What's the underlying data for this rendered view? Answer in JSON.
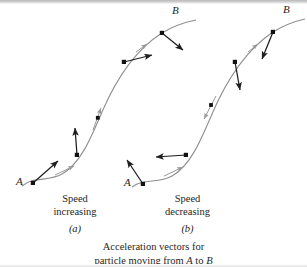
{
  "figure": {
    "caption_line1": "Acceleration vectors for",
    "caption_line2_pre": "particle moving from ",
    "caption_line2_a": "A",
    "caption_line2_mid": " to ",
    "caption_line2_b": "B",
    "background_color": "#ffffff",
    "curve_color": "#8a8a8a",
    "vector_color": "#1e1e1e",
    "tangent_color": "#9a9a9a",
    "point_color": "#111111"
  },
  "panels": [
    {
      "id": "a",
      "letter": "(a)",
      "start_label": "A",
      "end_label": "B",
      "caption_word1": "Speed",
      "caption_word2": "increasing",
      "curve_path": "M 22 186 C 34 176 48 182 62 174 C 80 164 90 140 102 112 C 114 84 132 52 162 33 C 175 25 186 22 196 20",
      "points": [
        {
          "name": "A",
          "x": 33,
          "y": 183
        },
        {
          "name": "p2",
          "x": 77,
          "y": 155
        },
        {
          "name": "p3",
          "x": 98,
          "y": 118
        },
        {
          "name": "p4",
          "x": 124,
          "y": 62
        },
        {
          "name": "B",
          "x": 162,
          "y": 33
        }
      ],
      "acceleration_vectors": [
        {
          "from_x": 33,
          "from_y": 183,
          "to_x": 58,
          "to_y": 161
        },
        {
          "from_x": 77,
          "from_y": 155,
          "to_x": 75,
          "to_y": 128
        },
        {
          "from_x": 124,
          "from_y": 62,
          "to_x": 152,
          "to_y": 55
        },
        {
          "from_x": 162,
          "from_y": 33,
          "to_x": 183,
          "to_y": 50
        }
      ],
      "tangent_arrows": [
        {
          "from_x": 55,
          "from_y": 175,
          "to_x": 74,
          "to_y": 166
        },
        {
          "from_x": 93,
          "from_y": 130,
          "to_x": 101,
          "to_y": 108
        },
        {
          "from_x": 136,
          "from_y": 52,
          "to_x": 147,
          "to_y": 44
        }
      ],
      "start_label_pos": {
        "x": 16,
        "y": 182
      },
      "end_label_pos": {
        "x": 172,
        "y": 10
      },
      "caption_x": 60,
      "caption_y": 197,
      "letter_x": 64,
      "letter_y": 226
    },
    {
      "id": "b",
      "letter": "(b)",
      "start_label": "A",
      "end_label": "B",
      "caption_word1": "Speed",
      "caption_word2": "decreasing",
      "curve_path": "M 132 187 C 144 178 158 184 172 176 C 190 166 200 142 212 114 C 224 86 243 52 273 32 C 286 24 296 21 305 19",
      "points": [
        {
          "name": "A",
          "x": 143,
          "y": 184
        },
        {
          "name": "p2",
          "x": 186,
          "y": 155
        },
        {
          "name": "p3",
          "x": 211,
          "y": 105
        },
        {
          "name": "p4",
          "x": 235,
          "y": 62
        },
        {
          "name": "B",
          "x": 273,
          "y": 32
        }
      ],
      "acceleration_vectors": [
        {
          "from_x": 143,
          "from_y": 184,
          "to_x": 127,
          "to_y": 160
        },
        {
          "from_x": 186,
          "from_y": 155,
          "to_x": 156,
          "to_y": 157
        },
        {
          "from_x": 235,
          "from_y": 62,
          "to_x": 240,
          "to_y": 90
        },
        {
          "from_x": 273,
          "from_y": 32,
          "to_x": 262,
          "to_y": 59
        }
      ],
      "tangent_arrows": [
        {
          "from_x": 164,
          "from_y": 176,
          "to_x": 183,
          "to_y": 167
        },
        {
          "from_x": 216,
          "from_y": 96,
          "to_x": 204,
          "to_y": 119
        },
        {
          "from_x": 248,
          "from_y": 52,
          "to_x": 258,
          "to_y": 44
        }
      ],
      "start_label_pos": {
        "x": 126,
        "y": 183
      },
      "end_label_pos": {
        "x": 283,
        "y": 9
      },
      "caption_x": 170,
      "caption_y": 197,
      "letter_x": 174,
      "letter_y": 226
    }
  ]
}
